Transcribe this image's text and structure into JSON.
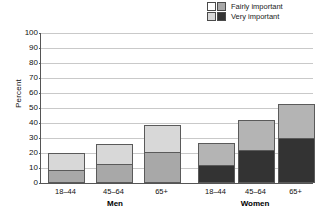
{
  "legend": {
    "rows": [
      {
        "label": "Fairly important",
        "swatch_left": "#ffffff",
        "swatch_right": "#a8a8a8"
      },
      {
        "label": "Very important",
        "swatch_left": "#d8d8d8",
        "swatch_right": "#333333"
      }
    ]
  },
  "axis": {
    "ylabel": "Percent",
    "yticks": [
      "0",
      "10",
      "20",
      "30",
      "40",
      "50",
      "60",
      "70",
      "80",
      "90",
      "100"
    ]
  },
  "groups": [
    {
      "name": "Men",
      "label": "Men"
    },
    {
      "name": "Women",
      "label": "Women"
    }
  ],
  "colors": {
    "men_fairly": "#d8d8d8",
    "men_very": "#a8a8a8",
    "women_fairly": "#b4b4b4",
    "women_very": "#333333",
    "bar_border": "#5a5a5a",
    "gridline": "#c9c9c9",
    "axis": "#555555"
  },
  "chart_data": {
    "type": "bar",
    "title": "",
    "xlabel": "",
    "ylabel": "Percent",
    "ylim": [
      0,
      100
    ],
    "ytick_step": 10,
    "grid": true,
    "stacked": true,
    "legend_position": "top-right",
    "groups": [
      "Men",
      "Women"
    ],
    "categories": [
      "18–44",
      "45–64",
      "65+"
    ],
    "series": [
      {
        "name": "Very important",
        "group": "Men",
        "values": [
          9,
          13,
          21
        ]
      },
      {
        "name": "Fairly important",
        "group": "Men",
        "values": [
          11,
          13,
          18
        ]
      },
      {
        "name": "Very important",
        "group": "Women",
        "values": [
          12,
          22,
          30
        ]
      },
      {
        "name": "Fairly important",
        "group": "Women",
        "values": [
          15,
          20,
          23
        ]
      }
    ],
    "totals": {
      "Men": [
        20,
        26,
        39
      ],
      "Women": [
        27,
        42,
        53
      ]
    }
  },
  "bars": [
    {
      "group": "Men",
      "cat": "18–44",
      "very": 9,
      "fairly": 11,
      "total": 20,
      "x": 47,
      "w": 37,
      "fill_very": "#a8a8a8",
      "fill_fairly": "#d8d8d8"
    },
    {
      "group": "Men",
      "cat": "45–64",
      "very": 13,
      "fairly": 13,
      "total": 26,
      "x": 95,
      "w": 37,
      "fill_very": "#a8a8a8",
      "fill_fairly": "#d8d8d8"
    },
    {
      "group": "Men",
      "cat": "65+",
      "very": 21,
      "fairly": 18,
      "total": 39,
      "x": 143,
      "w": 37,
      "fill_very": "#a8a8a8",
      "fill_fairly": "#d8d8d8"
    },
    {
      "group": "Women",
      "cat": "18–44",
      "very": 12,
      "fairly": 15,
      "total": 27,
      "x": 197,
      "w": 37,
      "fill_very": "#333333",
      "fill_fairly": "#b4b4b4"
    },
    {
      "group": "Women",
      "cat": "45–64",
      "very": 22,
      "fairly": 20,
      "total": 42,
      "x": 237,
      "w": 37,
      "fill_very": "#333333",
      "fill_fairly": "#b4b4b4"
    },
    {
      "group": "Women",
      "cat": "65+",
      "very": 30,
      "fairly": 23,
      "total": 53,
      "x": 277,
      "w": 37,
      "fill_very": "#333333",
      "fill_fairly": "#b4b4b4"
    }
  ],
  "group_positions": [
    {
      "label": "Men",
      "x": 60,
      "w": 110
    },
    {
      "label": "Women",
      "x": 200,
      "w": 110
    }
  ]
}
